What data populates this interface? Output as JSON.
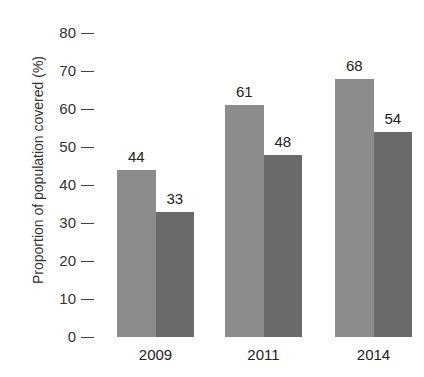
{
  "chart_data": {
    "type": "bar",
    "title": "",
    "xlabel": "",
    "ylabel": "Proportion of population covered (%)",
    "categories": [
      "2009",
      "2011",
      "2014"
    ],
    "series": [
      {
        "name": "Series 1",
        "color": "#8c8c8c",
        "values": [
          44,
          61,
          68
        ]
      },
      {
        "name": "Series 2",
        "color": "#6a6a6a",
        "values": [
          33,
          48,
          54
        ]
      }
    ],
    "ylim": [
      0,
      80
    ],
    "yticks": [
      "0",
      "10",
      "20",
      "30",
      "40",
      "50",
      "60",
      "70",
      "80"
    ],
    "grid": false,
    "legend": null
  },
  "labels": {
    "ylabel": "Proportion of population covered (%)",
    "v": [
      "44",
      "33",
      "61",
      "48",
      "68",
      "54"
    ]
  }
}
